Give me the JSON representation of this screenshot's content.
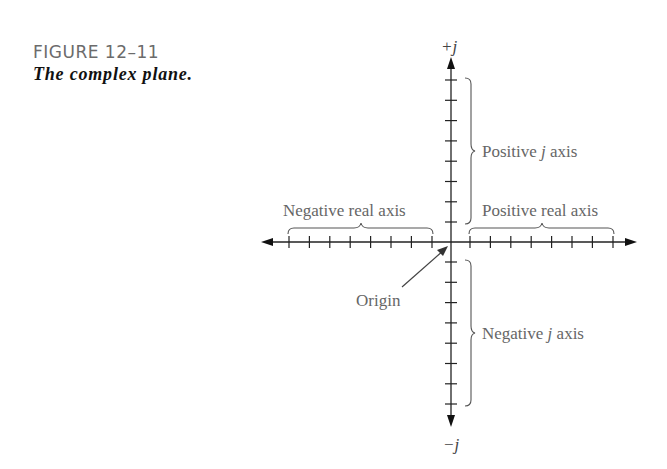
{
  "figure": {
    "number": "FIGURE 12–11",
    "title": "The complex plane."
  },
  "diagram": {
    "type": "complex-plane",
    "axis_top_label": "+j",
    "axis_bottom_label": "−j",
    "labels": {
      "negative_real": "Negative real axis",
      "positive_real": "Positive real axis",
      "positive_j": {
        "prefix": "Positive ",
        "j": "j",
        "suffix": " axis"
      },
      "negative_j": {
        "prefix": "Negative ",
        "j": "j",
        "suffix": " axis"
      },
      "origin": "Origin"
    },
    "ticks_per_half_axis": 8,
    "colors": {
      "axis": "#222222",
      "label": "#666666",
      "bracket": "#555555",
      "caption_number": "#6b6b6b"
    }
  }
}
